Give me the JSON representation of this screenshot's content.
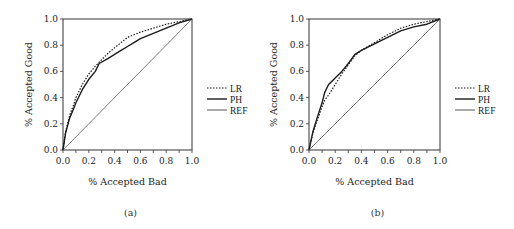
{
  "chart_data": [
    {
      "id": "a",
      "type": "line",
      "caption": "(a)",
      "xlabel": "% Accepted Bad",
      "ylabel": "% Accepted Good",
      "xlim": [
        0,
        1
      ],
      "ylim": [
        0,
        1
      ],
      "x_ticks": [
        "0.0",
        "0.2",
        "0.4",
        "0.6",
        "0.8",
        "1.0"
      ],
      "y_ticks": [
        "0.0",
        "0.2",
        "0.4",
        "0.6",
        "0.8",
        "1.0"
      ],
      "grid": false,
      "legend_position": "right",
      "legend": [
        "LR",
        "PH",
        "REF"
      ],
      "series": [
        {
          "name": "LR",
          "style": "dotted",
          "x": [
            0,
            0.02,
            0.05,
            0.08,
            0.1,
            0.15,
            0.2,
            0.25,
            0.3,
            0.35,
            0.4,
            0.45,
            0.5,
            0.55,
            0.6,
            0.7,
            0.8,
            0.9,
            1.0
          ],
          "y": [
            0,
            0.14,
            0.26,
            0.34,
            0.4,
            0.5,
            0.58,
            0.64,
            0.69,
            0.74,
            0.78,
            0.82,
            0.86,
            0.88,
            0.9,
            0.93,
            0.96,
            0.98,
            1.0
          ]
        },
        {
          "name": "PH",
          "style": "solid",
          "x": [
            0,
            0.02,
            0.05,
            0.08,
            0.1,
            0.15,
            0.2,
            0.25,
            0.28,
            0.35,
            0.4,
            0.45,
            0.5,
            0.55,
            0.6,
            0.7,
            0.8,
            0.9,
            1.0
          ],
          "y": [
            0,
            0.13,
            0.24,
            0.31,
            0.36,
            0.46,
            0.54,
            0.6,
            0.66,
            0.7,
            0.73,
            0.76,
            0.79,
            0.82,
            0.85,
            0.89,
            0.93,
            0.97,
            1.0
          ]
        },
        {
          "name": "REF",
          "style": "thin",
          "x": [
            0,
            1
          ],
          "y": [
            0,
            1
          ]
        }
      ]
    },
    {
      "id": "b",
      "type": "line",
      "caption": "(b)",
      "xlabel": "% Accepted Bad",
      "ylabel": "% Accepted Good",
      "xlim": [
        0,
        1
      ],
      "ylim": [
        0,
        1
      ],
      "x_ticks": [
        "0.0",
        "0.2",
        "0.4",
        "0.6",
        "0.8",
        "1.0"
      ],
      "y_ticks": [
        "0.0",
        "0.2",
        "0.4",
        "0.6",
        "0.8",
        "1.0"
      ],
      "grid": false,
      "legend_position": "right",
      "legend": [
        "LR",
        "PH",
        "REF"
      ],
      "series": [
        {
          "name": "LR",
          "style": "dotted",
          "x": [
            0,
            0.03,
            0.06,
            0.1,
            0.12,
            0.15,
            0.2,
            0.25,
            0.3,
            0.35,
            0.4,
            0.5,
            0.6,
            0.7,
            0.8,
            0.9,
            1.0
          ],
          "y": [
            0,
            0.13,
            0.22,
            0.33,
            0.38,
            0.42,
            0.5,
            0.58,
            0.65,
            0.72,
            0.76,
            0.82,
            0.88,
            0.93,
            0.96,
            0.98,
            1.0
          ]
        },
        {
          "name": "PH",
          "style": "solid",
          "x": [
            0,
            0.03,
            0.06,
            0.1,
            0.12,
            0.15,
            0.2,
            0.25,
            0.3,
            0.35,
            0.4,
            0.5,
            0.6,
            0.7,
            0.8,
            0.9,
            1.0
          ],
          "y": [
            0,
            0.14,
            0.24,
            0.36,
            0.44,
            0.5,
            0.55,
            0.6,
            0.66,
            0.73,
            0.76,
            0.81,
            0.86,
            0.91,
            0.94,
            0.96,
            1.0
          ]
        },
        {
          "name": "REF",
          "style": "thin",
          "x": [
            0,
            1
          ],
          "y": [
            0,
            1
          ]
        }
      ]
    }
  ],
  "layout": {
    "panels": [
      {
        "left": 63,
        "top": 19,
        "right": 192,
        "bottom": 150,
        "legend_x": 207,
        "legend_y": 88,
        "xlabel_y": 185,
        "ylabel_x": 32,
        "caption_y": 216
      },
      {
        "left": 309,
        "top": 19,
        "right": 440,
        "bottom": 150,
        "legend_x": 455,
        "legend_y": 88,
        "xlabel_y": 185,
        "ylabel_x": 277,
        "caption_y": 216
      }
    ],
    "colors": {
      "axis": "#333333",
      "line": "#1a1a1a",
      "ref": "#444444",
      "text": "#222222"
    }
  }
}
